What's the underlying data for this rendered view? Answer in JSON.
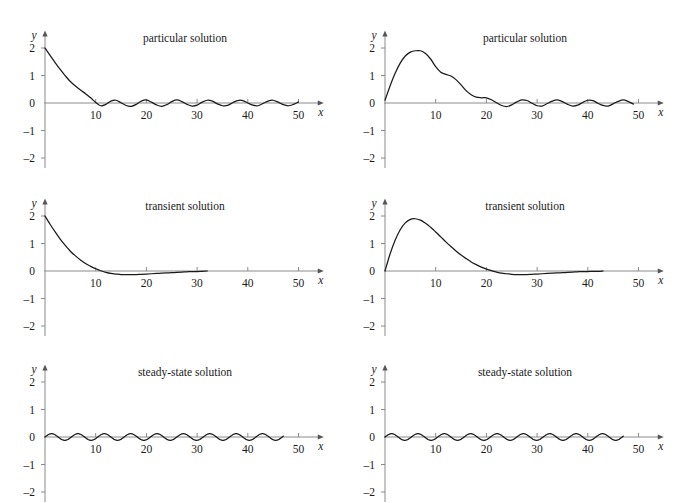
{
  "figure": {
    "rows": 3,
    "cols": 2,
    "background": "#ffffff",
    "curve_color": "#1a1a1a",
    "axis_color": "#8a8a8a",
    "text_color": "#1a1a1a"
  },
  "axes_common": {
    "xlabel": "x",
    "ylabel": "y",
    "xticks": [
      10,
      20,
      30,
      40,
      50
    ],
    "xtick_labels": [
      "10",
      "20",
      "30",
      "40",
      "50"
    ],
    "yticks": [
      2,
      1,
      0,
      -1,
      -2
    ],
    "ytick_labels": [
      "2",
      "1",
      "0",
      "–1",
      "–2"
    ],
    "xlim": [
      0,
      54
    ],
    "ylim": [
      -2.45,
      2.6
    ],
    "grid": false,
    "legend": "none"
  },
  "panels": [
    {
      "id": "p0",
      "title": "particular solution",
      "position": "top-left"
    },
    {
      "id": "p1",
      "title": "particular solution",
      "position": "top-right"
    },
    {
      "id": "p2",
      "title": "transient solution",
      "position": "middle-left"
    },
    {
      "id": "p3",
      "title": "transient solution",
      "position": "middle-right"
    },
    {
      "id": "p4",
      "title": "steady-state solution",
      "position": "bottom-left"
    },
    {
      "id": "p5",
      "title": "steady-state solution",
      "position": "bottom-right"
    }
  ],
  "chart_data": [
    {
      "id": "p0",
      "type": "line",
      "title": "particular solution",
      "xlabel": "x",
      "ylabel": "y",
      "xlim": [
        0,
        54
      ],
      "ylim": [
        -2.45,
        2.6
      ],
      "xticks": [
        10,
        20,
        30,
        40,
        50
      ],
      "yticks": [
        2,
        1,
        0,
        -1,
        -2
      ],
      "grid": false,
      "description": "Decaying transient from y=2 plus small steady-state oscillation; curve drawn for 0 <= x <= 50.",
      "series": [
        {
          "name": "particular solution",
          "x": [
            0,
            1,
            2,
            3,
            4,
            5,
            6,
            7,
            8,
            9,
            10,
            11,
            12,
            13,
            14,
            15,
            16,
            17,
            18,
            19,
            20,
            21,
            22,
            23,
            24,
            25,
            26,
            27,
            28,
            29,
            30,
            31,
            32,
            33,
            34,
            35,
            36,
            37,
            38,
            39,
            40,
            41,
            42,
            43,
            44,
            45,
            46,
            47,
            48,
            49,
            50
          ],
          "y": [
            2.0,
            1.73,
            1.47,
            1.22,
            0.99,
            0.78,
            0.62,
            0.47,
            0.34,
            0.19,
            0.02,
            -0.1,
            -0.05,
            0.07,
            0.1,
            0.01,
            -0.09,
            -0.12,
            -0.05,
            0.07,
            0.11,
            0.03,
            -0.07,
            -0.12,
            -0.06,
            0.05,
            0.11,
            0.05,
            -0.05,
            -0.11,
            -0.08,
            0.03,
            0.1,
            0.07,
            -0.03,
            -0.1,
            -0.09,
            0.01,
            0.09,
            0.09,
            0.0,
            -0.08,
            -0.1,
            -0.02,
            0.07,
            0.1,
            0.03,
            -0.06,
            -0.1,
            -0.05,
            0.04
          ]
        }
      ]
    },
    {
      "id": "p1",
      "type": "line",
      "title": "particular solution",
      "xlabel": "x",
      "ylabel": "y",
      "xlim": [
        0,
        54
      ],
      "ylim": [
        -2.45,
        2.6
      ],
      "xticks": [
        10,
        20,
        30,
        40,
        50
      ],
      "yticks": [
        2,
        1,
        0,
        -1,
        -2
      ],
      "grid": false,
      "description": "Rising transient peaking near y=1.9 at x=7 with a shoulder near x=12, decaying into a small steady oscillation; curve drawn for 0 <= x <= 49.",
      "series": [
        {
          "name": "particular solution",
          "x": [
            0,
            1,
            2,
            3,
            4,
            5,
            6,
            7,
            8,
            9,
            10,
            11,
            12,
            13,
            14,
            15,
            16,
            17,
            18,
            19,
            20,
            21,
            22,
            23,
            24,
            25,
            26,
            27,
            28,
            29,
            30,
            31,
            32,
            33,
            34,
            35,
            36,
            37,
            38,
            39,
            40,
            41,
            42,
            43,
            44,
            45,
            46,
            47,
            48,
            49
          ],
          "y": [
            0.1,
            0.62,
            1.08,
            1.45,
            1.71,
            1.85,
            1.9,
            1.9,
            1.8,
            1.6,
            1.32,
            1.12,
            1.04,
            0.98,
            0.85,
            0.66,
            0.45,
            0.3,
            0.21,
            0.19,
            0.19,
            0.12,
            0.01,
            -0.09,
            -0.13,
            -0.07,
            0.04,
            0.11,
            0.09,
            -0.01,
            -0.1,
            -0.11,
            -0.02,
            0.07,
            0.11,
            0.05,
            -0.05,
            -0.11,
            -0.08,
            0.02,
            0.1,
            0.09,
            -0.01,
            -0.09,
            -0.11,
            -0.03,
            0.06,
            0.11,
            0.05,
            -0.04
          ]
        }
      ]
    },
    {
      "id": "p2",
      "type": "line",
      "title": "transient solution",
      "xlabel": "x",
      "ylabel": "y",
      "xlim": [
        0,
        54
      ],
      "ylim": [
        -2.45,
        2.6
      ],
      "xticks": [
        10,
        20,
        30,
        40,
        50
      ],
      "yticks": [
        2,
        1,
        0,
        -1,
        -2
      ],
      "grid": false,
      "description": "Smooth decay from y=2, crossing zero near x=11, shallow minimum about -0.13 near x=18, approaching zero; curve drawn for 0 <= x <= 32.",
      "series": [
        {
          "name": "transient solution",
          "x": [
            0,
            1,
            2,
            3,
            4,
            5,
            6,
            7,
            8,
            9,
            10,
            11,
            12,
            13,
            14,
            15,
            16,
            17,
            18,
            19,
            20,
            21,
            22,
            23,
            24,
            25,
            26,
            27,
            28,
            29,
            30,
            31,
            32
          ],
          "y": [
            2.0,
            1.7,
            1.42,
            1.16,
            0.93,
            0.72,
            0.55,
            0.4,
            0.27,
            0.17,
            0.08,
            0.01,
            -0.05,
            -0.09,
            -0.11,
            -0.13,
            -0.13,
            -0.13,
            -0.13,
            -0.12,
            -0.11,
            -0.1,
            -0.09,
            -0.08,
            -0.07,
            -0.06,
            -0.05,
            -0.04,
            -0.03,
            -0.02,
            -0.02,
            -0.01,
            0.0
          ]
        }
      ]
    },
    {
      "id": "p3",
      "type": "line",
      "title": "transient solution",
      "xlabel": "x",
      "ylabel": "y",
      "xlim": [
        0,
        54
      ],
      "ylim": [
        -2.45,
        2.6
      ],
      "xticks": [
        10,
        20,
        30,
        40,
        50
      ],
      "yticks": [
        2,
        1,
        0,
        -1,
        -2
      ],
      "grid": false,
      "description": "Rises from 0 to a maximum near y=1.9 at x=6, decays through zero near x=21 to a shallow minimum about -0.13 near x=28, then back to zero; curve drawn for 0 <= x <= 43.",
      "series": [
        {
          "name": "transient solution",
          "x": [
            0,
            1,
            2,
            3,
            4,
            5,
            6,
            7,
            8,
            9,
            10,
            11,
            12,
            13,
            14,
            15,
            16,
            17,
            18,
            19,
            20,
            21,
            22,
            23,
            24,
            25,
            26,
            27,
            28,
            29,
            30,
            31,
            32,
            33,
            34,
            35,
            36,
            37,
            38,
            39,
            40,
            41,
            42,
            43
          ],
          "y": [
            0.0,
            0.62,
            1.12,
            1.5,
            1.75,
            1.88,
            1.9,
            1.85,
            1.74,
            1.59,
            1.42,
            1.24,
            1.06,
            0.89,
            0.73,
            0.58,
            0.45,
            0.33,
            0.23,
            0.14,
            0.07,
            0.01,
            -0.04,
            -0.08,
            -0.1,
            -0.12,
            -0.13,
            -0.13,
            -0.13,
            -0.12,
            -0.11,
            -0.1,
            -0.09,
            -0.08,
            -0.07,
            -0.06,
            -0.05,
            -0.04,
            -0.03,
            -0.02,
            -0.02,
            -0.01,
            -0.01,
            0.0
          ]
        }
      ]
    },
    {
      "id": "p4",
      "type": "line",
      "title": "steady-state solution",
      "xlabel": "x",
      "ylabel": "y",
      "xlim": [
        0,
        54
      ],
      "ylim": [
        -2.45,
        2.6
      ],
      "xticks": [
        10,
        20,
        30,
        40,
        50
      ],
      "yticks": [
        2,
        1,
        0,
        -1,
        -2
      ],
      "grid": false,
      "description": "Pure sinusoid of amplitude about 0.12 and period about 5.2, starting at zero going upward; curve drawn for 0 <= x <= 47.",
      "series": [
        {
          "name": "steady-state solution",
          "amplitude": 0.12,
          "period": 5.2,
          "phase": 0.0,
          "x_start": 0,
          "x_end": 47
        }
      ]
    },
    {
      "id": "p5",
      "type": "line",
      "title": "steady-state solution",
      "xlabel": "x",
      "ylabel": "y",
      "xlim": [
        0,
        54
      ],
      "ylim": [
        -2.45,
        2.6
      ],
      "xticks": [
        10,
        20,
        30,
        40,
        50
      ],
      "yticks": [
        2,
        1,
        0,
        -1,
        -2
      ],
      "grid": false,
      "description": "Pure sinusoid of amplitude about 0.12 and period about 5.2, starting at zero going upward; curve drawn for 0 <= x <= 47.",
      "series": [
        {
          "name": "steady-state solution",
          "amplitude": 0.12,
          "period": 5.2,
          "phase": 0.0,
          "x_start": 0,
          "x_end": 47
        }
      ]
    }
  ]
}
